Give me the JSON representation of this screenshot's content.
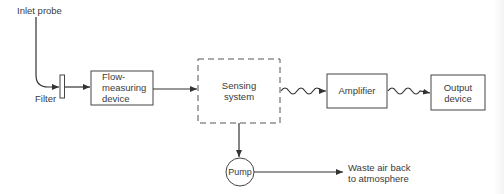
{
  "diagram": {
    "title": "",
    "labels": {
      "inlet_probe": "Inlet probe",
      "filter": "Filter",
      "flow_measuring_device": "Flow-\nmeasuring\ndevice",
      "sensing_system": "Sensing\nsystem",
      "amplifier": "Amplifier",
      "output_device": "Output\ndevice",
      "pump": "Pump",
      "waste_air": "Waste air back\nto atmosphere"
    },
    "nodes": [
      {
        "id": "inlet_probe",
        "type": "source"
      },
      {
        "id": "filter",
        "type": "filter"
      },
      {
        "id": "flow_measuring_device",
        "type": "box"
      },
      {
        "id": "sensing_system",
        "type": "dashed-box"
      },
      {
        "id": "amplifier",
        "type": "box"
      },
      {
        "id": "output_device",
        "type": "box"
      },
      {
        "id": "pump",
        "type": "circle"
      },
      {
        "id": "waste_air",
        "type": "sink"
      }
    ],
    "edges": [
      {
        "from": "inlet_probe",
        "to": "filter",
        "style": "solid-curve"
      },
      {
        "from": "filter",
        "to": "flow_measuring_device",
        "style": "solid"
      },
      {
        "from": "flow_measuring_device",
        "to": "sensing_system",
        "style": "solid"
      },
      {
        "from": "sensing_system",
        "to": "amplifier",
        "style": "wavy-signal"
      },
      {
        "from": "amplifier",
        "to": "output_device",
        "style": "wavy-signal"
      },
      {
        "from": "sensing_system",
        "to": "pump",
        "style": "solid"
      },
      {
        "from": "pump",
        "to": "waste_air",
        "style": "solid"
      }
    ],
    "colors": {
      "line": "#333333",
      "text": "#3a3a3a",
      "background": "#ffffff"
    }
  }
}
